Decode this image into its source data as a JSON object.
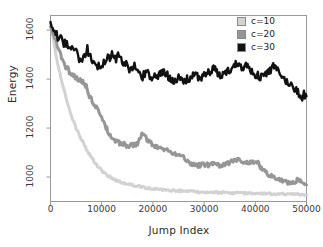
{
  "chart_data": {
    "type": "line",
    "title": "",
    "xlabel": "Jump Index",
    "ylabel": "Energy",
    "xlim": [
      0,
      50000
    ],
    "ylim": [
      900,
      1660
    ],
    "grid": false,
    "legend_position": "top-right",
    "xticks": [
      "0",
      "10000",
      "20000",
      "30000",
      "40000",
      "50000"
    ],
    "xtick_values": [
      0,
      10000,
      20000,
      30000,
      40000,
      50000
    ],
    "yticks": [
      "1000",
      "1200",
      "1400",
      "1600"
    ],
    "ytick_values": [
      1000,
      1200,
      1400,
      1600
    ],
    "series": [
      {
        "name": "c=10",
        "color": "#d2d2d2",
        "x": [
          0,
          500,
          1000,
          1500,
          2000,
          2500,
          3000,
          3500,
          4000,
          5000,
          6000,
          7000,
          8000,
          9000,
          10000,
          11000,
          12000,
          13000,
          14000,
          15000,
          16000,
          17000,
          18000,
          20000,
          22000,
          24000,
          26000,
          28000,
          30000,
          32000,
          34000,
          36000,
          38000,
          40000,
          42000,
          44000,
          46000,
          48000,
          50000
        ],
        "values": [
          1630,
          1570,
          1510,
          1455,
          1410,
          1365,
          1325,
          1290,
          1255,
          1200,
          1155,
          1115,
          1080,
          1050,
          1025,
          1008,
          995,
          985,
          978,
          972,
          968,
          963,
          958,
          952,
          948,
          945,
          942,
          940,
          938,
          937,
          936,
          935,
          934,
          933,
          932,
          931,
          930,
          929,
          928
        ]
      },
      {
        "name": "c=20",
        "color": "#969696",
        "x": [
          0,
          500,
          1000,
          1500,
          2000,
          2500,
          3000,
          3500,
          4000,
          4500,
          5000,
          5500,
          6000,
          6500,
          7000,
          7300,
          7600,
          8000,
          8500,
          9000,
          9500,
          10000,
          10500,
          11000,
          11500,
          12000,
          13000,
          14000,
          15000,
          16000,
          17000,
          17500,
          18000,
          18500,
          19000,
          20000,
          21000,
          22000,
          23000,
          24000,
          25000,
          26000,
          27000,
          28000,
          29000,
          30000,
          31000,
          32000,
          33000,
          34000,
          35000,
          36000,
          36500,
          37000,
          38000,
          39000,
          40000,
          40500,
          41000,
          42000,
          43000,
          44000,
          45000,
          46000,
          47000,
          48000,
          48500,
          49000,
          49500,
          50000
        ],
        "values": [
          1620,
          1585,
          1552,
          1522,
          1495,
          1472,
          1452,
          1437,
          1425,
          1414,
          1405,
          1398,
          1392,
          1385,
          1372,
          1340,
          1330,
          1318,
          1300,
          1282,
          1262,
          1240,
          1218,
          1196,
          1175,
          1158,
          1142,
          1135,
          1130,
          1128,
          1133,
          1160,
          1178,
          1165,
          1148,
          1132,
          1125,
          1118,
          1108,
          1098,
          1090,
          1080,
          1062,
          1050,
          1048,
          1052,
          1050,
          1055,
          1048,
          1052,
          1060,
          1068,
          1072,
          1065,
          1058,
          1060,
          1062,
          1058,
          1040,
          1018,
          1005,
          998,
          990,
          980,
          972,
          985,
          992,
          980,
          972,
          968
        ]
      },
      {
        "name": "c=30",
        "color": "#111111",
        "x": [
          0,
          400,
          800,
          1200,
          1600,
          2000,
          2400,
          2800,
          3200,
          3600,
          4000,
          4400,
          4800,
          5200,
          5600,
          6000,
          6400,
          6800,
          7200,
          7600,
          8000,
          8400,
          8800,
          9200,
          9600,
          10000,
          10400,
          10800,
          11200,
          11600,
          12000,
          12400,
          12800,
          13200,
          13600,
          14000,
          14400,
          14800,
          15200,
          15600,
          16000,
          16400,
          16800,
          17200,
          17600,
          18000,
          18400,
          18800,
          19200,
          19600,
          20000,
          21000,
          22000,
          23000,
          24000,
          25000,
          26000,
          27000,
          28000,
          29000,
          30000,
          31000,
          32000,
          33000,
          34000,
          35000,
          36000,
          36500,
          37000,
          37500,
          38000,
          38500,
          39000,
          40000,
          41000,
          42000,
          43000,
          43500,
          44000,
          44500,
          45000,
          46000,
          47000,
          48000,
          48500,
          49000,
          49500,
          50000
        ],
        "values": [
          1640,
          1605,
          1590,
          1578,
          1568,
          1562,
          1552,
          1545,
          1548,
          1536,
          1528,
          1520,
          1512,
          1500,
          1482,
          1470,
          1488,
          1505,
          1520,
          1498,
          1472,
          1455,
          1468,
          1452,
          1462,
          1452,
          1468,
          1485,
          1500,
          1488,
          1502,
          1490,
          1478,
          1495,
          1488,
          1472,
          1452,
          1462,
          1448,
          1435,
          1442,
          1452,
          1438,
          1425,
          1418,
          1408,
          1422,
          1432,
          1420,
          1412,
          1405,
          1418,
          1428,
          1412,
          1398,
          1402,
          1390,
          1402,
          1418,
          1405,
          1415,
          1428,
          1442,
          1412,
          1425,
          1438,
          1455,
          1472,
          1460,
          1448,
          1462,
          1450,
          1438,
          1420,
          1408,
          1420,
          1438,
          1452,
          1445,
          1428,
          1412,
          1392,
          1375,
          1358,
          1340,
          1322,
          1338,
          1330
        ]
      }
    ]
  },
  "legend": {
    "items": [
      {
        "label": "c=10",
        "color": "#d2d2d2"
      },
      {
        "label": "c=20",
        "color": "#969696"
      },
      {
        "label": "c=30",
        "color": "#111111"
      }
    ]
  }
}
